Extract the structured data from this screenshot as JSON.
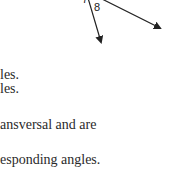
{
  "diagram": {
    "labels": [
      "7",
      "8"
    ]
  },
  "text_lines": [
    "les.",
    "les.",
    "ansversal and are",
    "esponding angles."
  ]
}
